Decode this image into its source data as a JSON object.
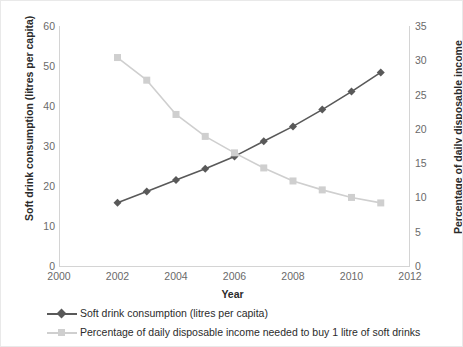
{
  "chart_data": {
    "type": "line",
    "title": "",
    "xlabel": "Year",
    "ylabel": "Soft drink consumption (litres per capita)",
    "y2label": "Percentage of daily disposable income",
    "x": [
      2002,
      2003,
      2004,
      2005,
      2006,
      2007,
      2008,
      2009,
      2010,
      2011
    ],
    "xlim": [
      2000,
      2012
    ],
    "xticks": [
      "2000",
      "2002",
      "2004",
      "2006",
      "2008",
      "2010",
      "2012"
    ],
    "xtick_values": [
      2000,
      2002,
      2004,
      2006,
      2008,
      2010,
      2012
    ],
    "ylim": [
      0,
      60
    ],
    "yticks": [
      "0",
      "10",
      "20",
      "30",
      "40",
      "50",
      "60"
    ],
    "ytick_values": [
      0,
      10,
      20,
      30,
      40,
      50,
      60
    ],
    "y2lim": [
      0,
      35
    ],
    "y2ticks": [
      "0",
      "5",
      "10",
      "15",
      "20",
      "25",
      "30",
      "35"
    ],
    "y2tick_values": [
      0,
      5,
      10,
      15,
      20,
      25,
      30,
      35
    ],
    "grid": false,
    "legend_position": "bottom-left",
    "series": [
      {
        "name": "Soft drink consumption (litres per capita)",
        "axis": "left",
        "color": "#595959",
        "marker": "diamond",
        "values": [
          15.8,
          18.6,
          21.5,
          24.3,
          27.4,
          31.2,
          34.9,
          39.1,
          43.6,
          48.4
        ]
      },
      {
        "name": "Percentage of daily disposable income needed to buy 1 litre of soft drinks",
        "axis": "right",
        "color": "#cfcfcf",
        "marker": "square",
        "values": [
          30.4,
          27.1,
          22.1,
          18.9,
          16.5,
          14.3,
          12.4,
          11.1,
          10.0,
          9.2
        ]
      }
    ]
  },
  "legend": {
    "items": [
      {
        "label": "Soft drink consumption (litres per capita)",
        "color": "#595959",
        "marker": "diamond"
      },
      {
        "label": "Percentage of daily disposable income needed to buy 1 litre of soft drinks",
        "color": "#cfcfcf",
        "marker": "square"
      }
    ]
  }
}
